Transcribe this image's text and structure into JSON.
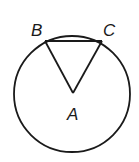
{
  "diagram": {
    "type": "circle-with-inscribed-triangle",
    "circle": {
      "center_label": "A",
      "cx": 72,
      "cy": 94,
      "r": 58
    },
    "points": [
      {
        "label": "B",
        "x": 45,
        "y": 41,
        "label_x": 31,
        "label_y": 36
      },
      {
        "label": "C",
        "x": 102,
        "y": 41,
        "label_x": 103,
        "label_y": 36
      },
      {
        "label": "A",
        "x": 73,
        "y": 93,
        "label_x": 67,
        "label_y": 120
      }
    ],
    "segments": [
      "AB",
      "AC",
      "BC"
    ],
    "stroke_color": "#1a1a1a"
  }
}
